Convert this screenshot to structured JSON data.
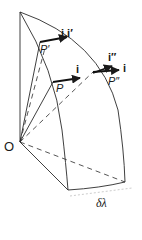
{
  "figure": {
    "type": "geometric diagram",
    "colors": {
      "line": "#1a1a1a",
      "background": "#ffffff"
    }
  },
  "labels": {
    "origin": "O",
    "point_p": "P",
    "point_p_prime": "P′",
    "point_p_double_prime": "P″",
    "vector_i_at_p": "i",
    "vector_i_at_p_prime": "i,i′",
    "vector_i_double_prime": "i″",
    "vector_i_at_p_double_prime": "i",
    "delta_lambda": "δλ"
  }
}
